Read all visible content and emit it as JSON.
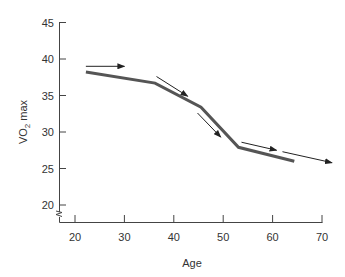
{
  "chart_data": {
    "type": "line",
    "title": "",
    "xlabel": "Age",
    "ylabel": "VO2 max",
    "ylabel_main": "VO",
    "ylabel_sub": "2",
    "ylabel_rest": " max",
    "xlim": [
      20,
      70
    ],
    "ylim": [
      20,
      45
    ],
    "x_ticks": [
      20,
      30,
      40,
      50,
      60,
      70
    ],
    "y_ticks": [
      20,
      25,
      30,
      35,
      40,
      45
    ],
    "grid": false,
    "legend": null,
    "axis_break": "y-axis below 20",
    "series": [
      {
        "name": "VO2 max decline with age",
        "color": "#555555",
        "x": [
          22.2,
          36.2,
          45.5,
          53.1,
          64.4
        ],
        "y": [
          38.2,
          36.7,
          33.4,
          27.9,
          26.0
        ]
      }
    ],
    "annotations": [
      {
        "type": "arrow",
        "from": [
          22.2,
          39.0
        ],
        "to": [
          30.0,
          39.0
        ]
      },
      {
        "type": "arrow",
        "from": [
          36.5,
          37.6
        ],
        "to": [
          42.8,
          34.9
        ]
      },
      {
        "type": "arrow",
        "from": [
          44.8,
          32.6
        ],
        "to": [
          49.5,
          29.3
        ]
      },
      {
        "type": "arrow",
        "from": [
          53.7,
          28.6
        ],
        "to": [
          60.8,
          27.5
        ]
      },
      {
        "type": "arrow",
        "from": [
          62.0,
          27.3
        ],
        "to": [
          72.0,
          25.8
        ]
      }
    ]
  }
}
